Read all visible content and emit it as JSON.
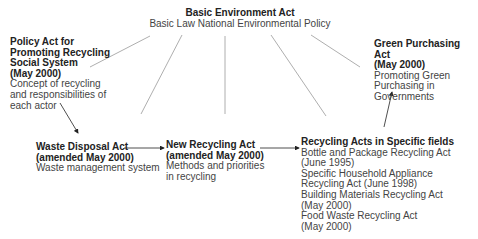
{
  "diagram": {
    "nodes": {
      "basic": {
        "title": "Basic Environment Act",
        "desc": "Basic Law National Environmental Policy"
      },
      "policy": {
        "title_lines": [
          "Policy Act for",
          "Promoting Recycling",
          "Social System",
          "(May 2000)"
        ],
        "desc_lines": [
          "Concept of recycling",
          "and responsibilities of",
          "each actor"
        ]
      },
      "green": {
        "title_lines": [
          "Green Purchasing Act",
          "(May 2000)"
        ],
        "desc_lines": [
          "Promoting Green",
          "Purchasing in",
          "Governments"
        ]
      },
      "waste": {
        "title_lines": [
          "Waste Disposal Act",
          "(amended May 2000)"
        ],
        "desc_lines": [
          "Waste management system"
        ]
      },
      "newrec": {
        "title_lines": [
          "New Recycling Act",
          "(amended May 2000)"
        ],
        "desc_lines": [
          "Methods and priorities",
          "in recycling"
        ]
      },
      "specific": {
        "title": "Recycling Acts in Specific fields",
        "items": [
          "Bottle and Package Recycling Act",
          "(June 1995)",
          "Specific Household Appliance",
          "Recycling Act (June 1998)",
          "Building Materials Recycling Act",
          "(May 2000)",
          "Food Waste Recycling Act",
          "(May 2000)"
        ]
      }
    },
    "edges": [
      {
        "from": "basic",
        "to": "policy",
        "arrow": false
      },
      {
        "from": "basic",
        "to": "waste",
        "arrow": false
      },
      {
        "from": "basic",
        "to": "newrec",
        "arrow": false
      },
      {
        "from": "basic",
        "to": "specific",
        "arrow": false
      },
      {
        "from": "basic",
        "to": "green",
        "arrow": false
      },
      {
        "from": "policy",
        "to": "waste",
        "arrow": true
      },
      {
        "from": "waste",
        "to": "newrec",
        "arrow": true
      },
      {
        "from": "newrec",
        "to": "specific",
        "arrow": true
      },
      {
        "from": "specific",
        "to": "green",
        "arrow": true
      }
    ],
    "colors": {
      "line": "#999999",
      "arrow": "#222222"
    }
  }
}
